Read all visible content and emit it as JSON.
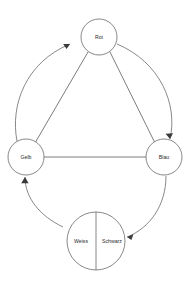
{
  "diagram": {
    "background_color": "#ffffff",
    "stroke_color": "#6a6a6a",
    "text_color": "#2b2b2b",
    "nodes": [
      {
        "id": "rot",
        "label": "Rot",
        "cx": 99,
        "cy": 37,
        "r": 18,
        "shape": "circle"
      },
      {
        "id": "gelb",
        "label": "Gelb",
        "cx": 26,
        "cy": 157,
        "r": 18,
        "shape": "circle"
      },
      {
        "id": "blau",
        "label": "Blau",
        "cx": 164,
        "cy": 157,
        "r": 18,
        "shape": "circle"
      },
      {
        "id": "weiss",
        "label": "Weiss",
        "cx": 82,
        "cy": 241,
        "r": 29,
        "shape": "half-circle-left"
      },
      {
        "id": "schwarz",
        "label": "Schwarz",
        "cx": 110,
        "cy": 241,
        "r": 29,
        "shape": "half-circle-right"
      }
    ],
    "edges": [
      {
        "id": "rot-gelb",
        "from": "Rot",
        "to": "Gelb",
        "style": "straight",
        "arrow": false
      },
      {
        "id": "rot-blau",
        "from": "Rot",
        "to": "Blau",
        "style": "straight",
        "arrow": false
      },
      {
        "id": "gelb-blau",
        "from": "Gelb",
        "to": "Blau",
        "style": "straight",
        "arrow": false
      },
      {
        "id": "gelb-rot",
        "from": "Gelb",
        "to": "Rot",
        "style": "curved",
        "arrow": true
      },
      {
        "id": "rot-blau-arc",
        "from": "Rot",
        "to": "Blau",
        "style": "curved",
        "arrow": true
      },
      {
        "id": "weiss-gelb",
        "from": "Weiss",
        "to": "Gelb",
        "style": "curved",
        "arrow": true
      },
      {
        "id": "blau-schwarz",
        "from": "Blau",
        "to": "Schwarz",
        "style": "curved",
        "arrow": true
      }
    ]
  }
}
